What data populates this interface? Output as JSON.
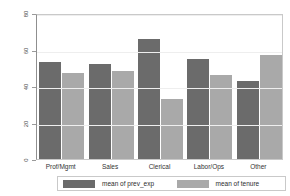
{
  "chart_data": {
    "type": "bar",
    "title": "",
    "xlabel": "",
    "ylabel": "percent",
    "categories": [
      "Prof/Mgmt",
      "Sales",
      "Clerical",
      "Labor/Ops",
      "Other"
    ],
    "series": [
      {
        "name": "mean of prev_exp",
        "color": "#6b6b6b",
        "values": [
          53,
          52,
          66,
          55,
          43
        ]
      },
      {
        "name": "mean of tenure",
        "color": "#a9a9a9",
        "values": [
          47,
          48,
          33,
          46,
          57
        ]
      }
    ],
    "ylim": [
      0,
      80
    ],
    "yticks": [
      0,
      20,
      40,
      60,
      80
    ],
    "ytick_labels": [
      "0",
      "20",
      "40",
      "60",
      "80"
    ],
    "grid": true,
    "legend_position": "bottom",
    "legend_entries": [
      "mean of prev_exp",
      "mean of tenure"
    ],
    "annotations": []
  }
}
